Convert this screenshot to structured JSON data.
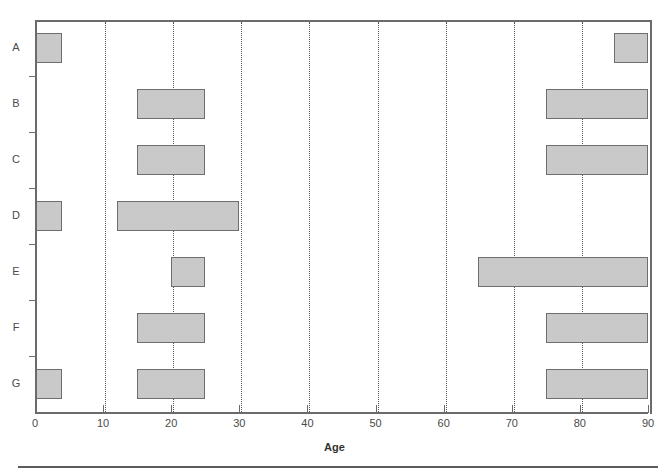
{
  "chart_data": {
    "type": "bar",
    "orientation": "horizontal",
    "title": "",
    "xlabel": "Age",
    "ylabel": "",
    "xlim": [
      0,
      90
    ],
    "xticks": [
      0,
      10,
      20,
      30,
      40,
      50,
      60,
      70,
      80,
      90
    ],
    "xticklabels": [
      "0",
      "10",
      "20",
      "30",
      "40",
      "50",
      "60",
      "70",
      "80",
      "90"
    ],
    "categories": [
      "A",
      "B",
      "C",
      "D",
      "E",
      "F",
      "G"
    ],
    "grid": "vertical-dotted",
    "legend": "none",
    "bar_fill_color": "#c9c9c9",
    "bar_edge_color": "#6e6e6e",
    "axis_color": "#6b6b6b",
    "intervals": [
      {
        "category": "A",
        "spans": [
          [
            0,
            4
          ],
          [
            85,
            90
          ]
        ]
      },
      {
        "category": "B",
        "spans": [
          [
            15,
            25
          ],
          [
            75,
            90
          ]
        ]
      },
      {
        "category": "C",
        "spans": [
          [
            15,
            25
          ],
          [
            75,
            90
          ]
        ]
      },
      {
        "category": "D",
        "spans": [
          [
            0,
            4
          ],
          [
            12,
            30
          ]
        ]
      },
      {
        "category": "E",
        "spans": [
          [
            20,
            25
          ],
          [
            65,
            90
          ]
        ]
      },
      {
        "category": "F",
        "spans": [
          [
            15,
            25
          ],
          [
            75,
            90
          ]
        ]
      },
      {
        "category": "G",
        "spans": [
          [
            0,
            4
          ],
          [
            15,
            25
          ],
          [
            75,
            90
          ]
        ]
      }
    ]
  },
  "axis": {
    "x_title": "Age"
  }
}
